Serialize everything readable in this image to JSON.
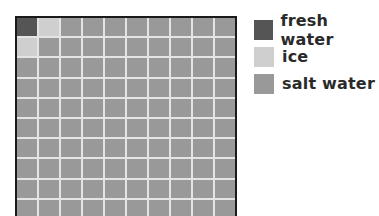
{
  "chart_data": {
    "type": "waffle",
    "title": "",
    "grid": {
      "rows": 10,
      "cols": 10,
      "total_cells": 100
    },
    "categories": [
      "fresh water",
      "ice",
      "salt water"
    ],
    "values": [
      1,
      2,
      97
    ],
    "units": "percent of cells",
    "colors": {
      "fresh water": "#555555",
      "ice": "#cfcfcf",
      "salt water": "#999999"
    },
    "cell_assignment": {
      "fresh water": [
        [
          0,
          0
        ]
      ],
      "ice": [
        [
          0,
          1
        ],
        [
          1,
          0
        ]
      ],
      "salt water": "all remaining cells"
    },
    "legend_position": "right"
  },
  "legend": {
    "items": [
      {
        "label": "fresh water",
        "color": "#555555"
      },
      {
        "label": "ice",
        "color": "#cfcfcf"
      },
      {
        "label": "salt water",
        "color": "#999999"
      }
    ]
  },
  "style": {
    "gridline_color": "#e4e4e4",
    "border_color": "#1a1a1a"
  }
}
